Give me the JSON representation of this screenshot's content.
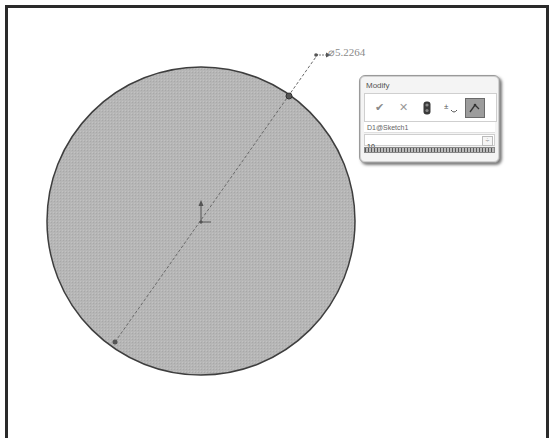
{
  "sketch": {
    "circle": {
      "cx": 201,
      "cy": 221,
      "r": 154,
      "fill": "#b4b4b4",
      "stroke": "#4a4a4a"
    },
    "diameter_line": {
      "x1": 115,
      "y1": 342,
      "x2": 316,
      "y2": 55
    },
    "endpoint_top": {
      "x": 289,
      "y": 96
    },
    "endpoint_bottom": {
      "x": 115,
      "y": 342
    },
    "dimension_label": "⌀5.2264"
  },
  "modify_dialog": {
    "title": "Modify",
    "toolbar": [
      {
        "name": "ok",
        "glyph": "✔"
      },
      {
        "name": "cancel",
        "glyph": "✕"
      },
      {
        "name": "rebuild",
        "glyph": "⬮"
      },
      {
        "name": "reverse-dimension",
        "glyph": "±"
      },
      {
        "name": "mark-for-drawing",
        "glyph": "↗"
      }
    ],
    "dimension_name": "D1@Sketch1",
    "value": "10",
    "spin_glyph": "÷"
  }
}
